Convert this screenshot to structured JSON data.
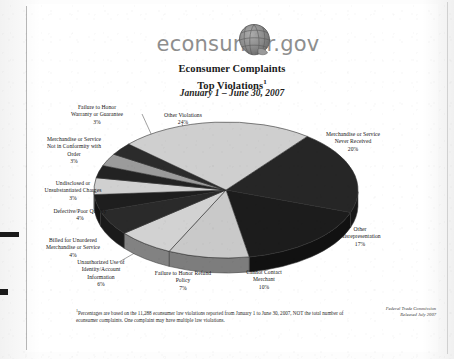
{
  "document": {
    "logo_text": "econsumer.gov",
    "logo_icon": "globe-icon",
    "title_line1": "Econsumer Complaints",
    "title_line2": "Top Violations",
    "title_footnote_marker": "1",
    "subtitle": "January 1 – June 30, 2007",
    "footnote_marker": "1",
    "footnote": "Percentages are based on the 11,288 econsumer law violations reported from January 1 to June 30, 2007, NOT the total number of econsumer complaints.  One complaint may have multiple law violations.",
    "credit_line1": "Federal Trade Commission",
    "credit_line2": "Released July 2007"
  },
  "chart_data": {
    "type": "pie",
    "title": "Econsumer Complaints Top Violations",
    "subtitle": "January 1 – June 30, 2007",
    "total_violations": "11,288",
    "units": "percent",
    "legend_position": "callout-labels",
    "grid": false,
    "categories": [
      "Merchandise or Service Never Received",
      "Other Misrepresentation",
      "Cannot Contact Merchant",
      "Failure to Honor Refund Policy",
      "Unauthorized Use of Identity/Account Information",
      "Billed for Unordered Merchandise or Service",
      "Defective/Poor Quality",
      "Undisclosed or Unsubstantiated Charges",
      "Merchandise or Service Not in Conformity with Order",
      "Failure to Honor Warranty or Guarantee",
      "Other Violations"
    ],
    "values": [
      20,
      17,
      10,
      7,
      6,
      4,
      4,
      3,
      3,
      3,
      24
    ],
    "colors": [
      "#262626",
      "#1c1c1c",
      "#c9c9c9",
      "#d2d2d2",
      "#2a2a2a",
      "#1e1e1e",
      "#d0d0d0",
      "#222222",
      "#9b9b9b",
      "#2b2b2b",
      "#cfcfcf"
    ]
  },
  "slices": [
    {
      "label_lines": [
        "Merchandise or Service",
        "Never Received"
      ],
      "percent": "20%",
      "value": 20,
      "color": "#262626"
    },
    {
      "label_lines": [
        "Other",
        "Misrepresentation"
      ],
      "percent": "17%",
      "value": 17,
      "color": "#1c1c1c"
    },
    {
      "label_lines": [
        "Cannot Contact",
        "Merchant"
      ],
      "percent": "10%",
      "value": 10,
      "color": "#c9c9c9"
    },
    {
      "label_lines": [
        "Failure to Honor Refund",
        "Policy"
      ],
      "percent": "7%",
      "value": 7,
      "color": "#d2d2d2"
    },
    {
      "label_lines": [
        "Unauthorized Use of",
        "Identity/Account",
        "Information"
      ],
      "percent": "6%",
      "value": 6,
      "color": "#2a2a2a"
    },
    {
      "label_lines": [
        "Billed for Unordered",
        "Merchandise or Service"
      ],
      "percent": "4%",
      "value": 4,
      "color": "#1e1e1e"
    },
    {
      "label_lines": [
        "Defective/Poor Quality"
      ],
      "percent": "4%",
      "value": 4,
      "color": "#d0d0d0"
    },
    {
      "label_lines": [
        "Undisclosed or",
        "Unsubstantiated Charges"
      ],
      "percent": "3%",
      "value": 3,
      "color": "#222222"
    },
    {
      "label_lines": [
        "Merchandise or Service",
        "Not in Conformity with",
        "Order"
      ],
      "percent": "3%",
      "value": 3,
      "color": "#9b9b9b"
    },
    {
      "label_lines": [
        "Failure to Honor",
        "Warranty or Guarantee"
      ],
      "percent": "3%",
      "value": 3,
      "color": "#2b2b2b"
    },
    {
      "label_lines": [
        "Other Violations"
      ],
      "percent": "24%",
      "value": 24,
      "color": "#cfcfcf"
    }
  ]
}
